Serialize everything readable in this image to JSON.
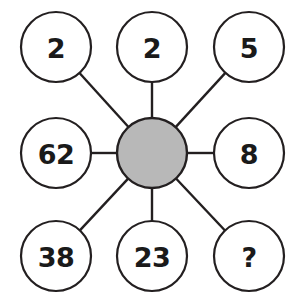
{
  "diagram": {
    "type": "hub-and-spoke",
    "background_color": "#ffffff",
    "stroke_color": "#231f20",
    "node_fill_color": "#ffffff",
    "hub_fill_color": "#b8b8b8",
    "canvas": {
      "width": 303,
      "height": 304
    },
    "hub": {
      "label": "",
      "cx": 152,
      "cy": 153,
      "r": 35,
      "fill": "#b8b8b8"
    },
    "nodes": [
      {
        "id": "top-left",
        "label": "2",
        "cx": 56,
        "cy": 47,
        "r": 35
      },
      {
        "id": "top-center",
        "label": "2",
        "cx": 152,
        "cy": 47,
        "r": 35
      },
      {
        "id": "top-right",
        "label": "5",
        "cx": 249,
        "cy": 47,
        "r": 35
      },
      {
        "id": "middle-left",
        "label": "62",
        "cx": 56,
        "cy": 153,
        "r": 35
      },
      {
        "id": "middle-right",
        "label": "8",
        "cx": 249,
        "cy": 153,
        "r": 35
      },
      {
        "id": "bottom-left",
        "label": "38",
        "cx": 56,
        "cy": 256,
        "r": 35
      },
      {
        "id": "bottom-center",
        "label": "23",
        "cx": 152,
        "cy": 256,
        "r": 35
      },
      {
        "id": "bottom-right",
        "label": "?",
        "cx": 249,
        "cy": 256,
        "r": 35
      }
    ]
  }
}
